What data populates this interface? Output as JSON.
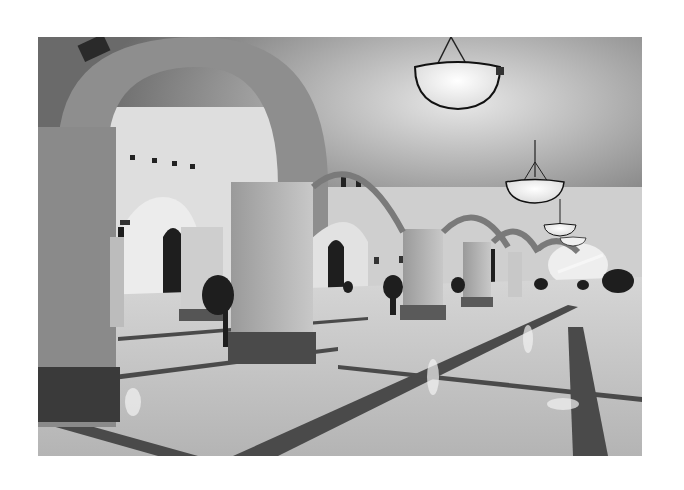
{
  "image": {
    "subject": "Arched interior corridor with vaulted ceiling, pendant lamps, and polished marble floor",
    "style": "black-and-white photograph",
    "colors": {
      "background": "#ffffff",
      "ceiling": "#9a9a9a",
      "wall": "#d8d8d8",
      "floor": "#c8c8c8",
      "floor_band": "#4a4a4a",
      "pillar_base": "#3c3c3c",
      "lamp_glow": "#f4f4f4"
    },
    "elements": [
      "vaulted-ceiling",
      "arches",
      "pillars",
      "pendant-lamps",
      "marble-floor",
      "potted-plants",
      "arched-doors",
      "wall-sconces"
    ]
  }
}
